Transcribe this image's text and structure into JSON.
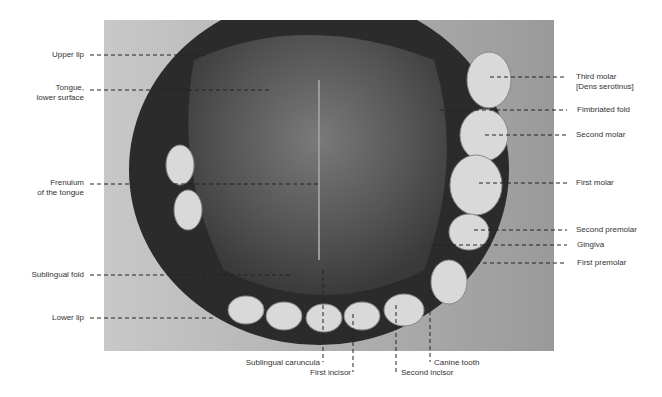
{
  "figure": {
    "labels_left": [
      {
        "id": "upper-lip",
        "text": "Upper lip",
        "x": 84,
        "y": 55
      },
      {
        "id": "tongue-lower-surface",
        "text": "Tongue,\nlower surface",
        "x": 84,
        "y": 87
      },
      {
        "id": "frenulum",
        "text": "Frenulum\nof the tongue",
        "x": 84,
        "y": 180
      },
      {
        "id": "sublingual-fold",
        "text": "Sublingual fold",
        "x": 84,
        "y": 274
      },
      {
        "id": "lower-lip",
        "text": "Lower lip",
        "x": 84,
        "y": 317
      }
    ],
    "labels_right": [
      {
        "id": "third-molar",
        "text": "Third molar\n[Dens serotinus]",
        "x": 576,
        "y": 73
      },
      {
        "id": "fimbriated-fold",
        "text": "Fimbriated fold",
        "x": 577,
        "y": 109
      },
      {
        "id": "second-molar",
        "text": "Second molar",
        "x": 576,
        "y": 134
      },
      {
        "id": "first-molar",
        "text": "First molar",
        "x": 576,
        "y": 181
      },
      {
        "id": "second-premolar",
        "text": "Second premolar",
        "x": 576,
        "y": 229
      },
      {
        "id": "gingiva",
        "text": "Gingiva",
        "x": 577,
        "y": 244
      },
      {
        "id": "first-premolar",
        "text": "First premolar",
        "x": 577,
        "y": 262
      }
    ],
    "labels_bottom": [
      {
        "id": "sublingual-caruncula",
        "text": "Sublingual caruncula",
        "x": 242,
        "y": 357
      },
      {
        "id": "first-incisor",
        "text": "First incisor",
        "x": 306,
        "y": 367
      },
      {
        "id": "second-incisor",
        "text": "Second incisor",
        "x": 401,
        "y": 367
      },
      {
        "id": "canine-tooth",
        "text": "Canine tooth",
        "x": 434,
        "y": 357
      }
    ]
  }
}
